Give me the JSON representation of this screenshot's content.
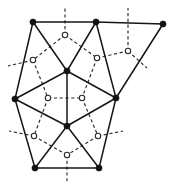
{
  "figure": {
    "kind": "graph-diagram",
    "caption": "",
    "width": 175,
    "height": 187,
    "background_color": "#ffffff"
  },
  "style": {
    "primal_edge_color": "#161616",
    "primal_edge_width": 1.5,
    "primal_vertex_color": "#121212",
    "primal_vertex_radius": 3.1,
    "dual_edge_color": "#2a2a2a",
    "dual_edge_width": 1.15,
    "dual_dash_pattern": "3.2 2.6",
    "dual_vertex_fill": "#ffffff",
    "dual_vertex_stroke": "#2a2a2a",
    "dual_vertex_radius": 2.7
  },
  "primal_vertices": [
    {
      "id": "tl",
      "label": "",
      "x": 33,
      "y": 22
    },
    {
      "id": "tm",
      "label": "",
      "x": 96,
      "y": 22
    },
    {
      "id": "tr",
      "label": "",
      "x": 163,
      "y": 24
    },
    {
      "id": "cu",
      "label": "",
      "x": 67,
      "y": 71
    },
    {
      "id": "lm",
      "label": "",
      "x": 15,
      "y": 99
    },
    {
      "id": "rm",
      "label": "",
      "x": 116,
      "y": 98
    },
    {
      "id": "cl",
      "label": "",
      "x": 67,
      "y": 126
    },
    {
      "id": "bl",
      "label": "",
      "x": 35,
      "y": 168
    },
    {
      "id": "br",
      "label": "",
      "x": 99,
      "y": 168
    }
  ],
  "primal_edges": [
    {
      "from": "tl",
      "to": "tm"
    },
    {
      "from": "tm",
      "to": "tr"
    },
    {
      "from": "tl",
      "to": "cu"
    },
    {
      "from": "tm",
      "to": "cu"
    },
    {
      "from": "tl",
      "to": "lm"
    },
    {
      "from": "cu",
      "to": "lm"
    },
    {
      "from": "cu",
      "to": "rm"
    },
    {
      "from": "tm",
      "to": "rm"
    },
    {
      "from": "tr",
      "to": "rm"
    },
    {
      "from": "cu",
      "to": "cl"
    },
    {
      "from": "lm",
      "to": "cl"
    },
    {
      "from": "rm",
      "to": "cl"
    },
    {
      "from": "lm",
      "to": "bl"
    },
    {
      "from": "cl",
      "to": "bl"
    },
    {
      "from": "cl",
      "to": "br"
    },
    {
      "from": "rm",
      "to": "br"
    },
    {
      "from": "bl",
      "to": "br"
    }
  ],
  "dual_vertices": [
    {
      "id": "f1",
      "label": "",
      "x": 65,
      "y": 35
    },
    {
      "id": "f2",
      "label": "",
      "x": 33,
      "y": 60
    },
    {
      "id": "f3",
      "label": "",
      "x": 97,
      "y": 58
    },
    {
      "id": "f4",
      "label": "",
      "x": 128,
      "y": 51
    },
    {
      "id": "f5",
      "label": "",
      "x": 48,
      "y": 98
    },
    {
      "id": "f6",
      "label": "",
      "x": 82,
      "y": 98
    },
    {
      "id": "f7",
      "label": "",
      "x": 34,
      "y": 136
    },
    {
      "id": "f8",
      "label": "",
      "x": 98,
      "y": 136
    },
    {
      "id": "f9",
      "label": "",
      "x": 67,
      "y": 155
    }
  ],
  "dual_edges": [
    {
      "from": "f1",
      "to": "f2"
    },
    {
      "from": "f1",
      "to": "f3"
    },
    {
      "from": "f2",
      "to": "f5"
    },
    {
      "from": "f3",
      "to": "f6"
    },
    {
      "from": "f3",
      "to": "f4"
    },
    {
      "from": "f5",
      "to": "f6"
    },
    {
      "from": "f5",
      "to": "f7"
    },
    {
      "from": "f6",
      "to": "f8"
    },
    {
      "from": "f7",
      "to": "f9"
    },
    {
      "from": "f8",
      "to": "f9"
    }
  ],
  "dual_rays": [
    {
      "from": "f1",
      "to_x": 65,
      "to_y": 6,
      "name": "ray-top-center"
    },
    {
      "from": "f4",
      "to_x": 128,
      "to_y": 8,
      "name": "ray-top-right"
    },
    {
      "from": "f2",
      "to_x": 8,
      "to_y": 66,
      "name": "ray-left-upper"
    },
    {
      "from": "f4",
      "to_x": 147,
      "to_y": 68,
      "name": "ray-right-upper"
    },
    {
      "from": "f7",
      "to_x": 9,
      "to_y": 131,
      "name": "ray-left-lower"
    },
    {
      "from": "f8",
      "to_x": 123,
      "to_y": 131,
      "name": "ray-right-lower"
    },
    {
      "from": "f9",
      "to_x": 67,
      "to_y": 181,
      "name": "ray-bottom-center"
    }
  ]
}
